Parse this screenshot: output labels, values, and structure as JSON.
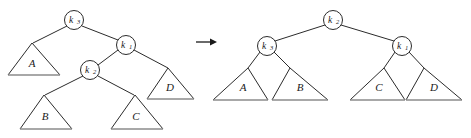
{
  "figure": {
    "transition_symbol": "→"
  },
  "colors": {
    "stroke": "#2b2b2b",
    "base_stroke": "#8b8b8b",
    "text": "#1a1a1a",
    "background": "#ffffff"
  },
  "left_tree": {
    "name": "before-rotation-tree",
    "nodes": [
      {
        "id": "L-k3",
        "key": "k",
        "subscript": "3",
        "label": "k3",
        "cx": 74,
        "cy": 20,
        "r": 9.5
      },
      {
        "id": "L-k1",
        "key": "k",
        "subscript": "1",
        "label": "k1",
        "cx": 126,
        "cy": 45,
        "r": 9.5
      },
      {
        "id": "L-k2",
        "key": "k",
        "subscript": "2",
        "label": "k2",
        "cx": 90,
        "cy": 70,
        "r": 9.5
      }
    ],
    "subtrees": [
      {
        "id": "L-A",
        "label": "A",
        "apex": [
          32,
          43
        ],
        "left": [
          8,
          75
        ],
        "right": [
          60,
          75
        ],
        "label_x": 32,
        "label_y": 64
      },
      {
        "id": "L-B",
        "label": "B",
        "apex": [
          44,
          95
        ],
        "left": [
          20,
          129
        ],
        "right": [
          72,
          129
        ],
        "label_x": 45,
        "label_y": 117
      },
      {
        "id": "L-C",
        "label": "C",
        "apex": [
          135,
          95
        ],
        "left": [
          111,
          129
        ],
        "right": [
          163,
          129
        ],
        "label_x": 136,
        "label_y": 117
      },
      {
        "id": "L-D",
        "label": "D",
        "apex": [
          168,
          68
        ],
        "left": [
          147,
          99
        ],
        "right": [
          194,
          99
        ],
        "label_x": 170,
        "label_y": 88
      }
    ],
    "edges": [
      {
        "from": "L-k3",
        "to": "L-A"
      },
      {
        "from": "L-k3",
        "to": "L-k1"
      },
      {
        "from": "L-k1",
        "to": "L-k2"
      },
      {
        "from": "L-k1",
        "to": "L-D"
      },
      {
        "from": "L-k2",
        "to": "L-B"
      },
      {
        "from": "L-k2",
        "to": "L-C"
      }
    ]
  },
  "right_tree": {
    "name": "after-rotation-tree",
    "nodes": [
      {
        "id": "R-k2",
        "key": "k",
        "subscript": "2",
        "label": "k2",
        "cx": 333,
        "cy": 20,
        "r": 9.5
      },
      {
        "id": "R-k3",
        "key": "k",
        "subscript": "3",
        "label": "k3",
        "cx": 267,
        "cy": 46,
        "r": 9.5
      },
      {
        "id": "R-k1",
        "key": "k",
        "subscript": "1",
        "label": "k1",
        "cx": 402,
        "cy": 46,
        "r": 9.5
      }
    ],
    "subtrees": [
      {
        "id": "R-A",
        "label": "A",
        "apex": [
          248,
          68
        ],
        "left": [
          213,
          100
        ],
        "right": [
          268,
          100
        ],
        "label_x": 243,
        "label_y": 88
      },
      {
        "id": "R-B",
        "label": "B",
        "apex": [
          290,
          68
        ],
        "left": [
          272,
          100
        ],
        "right": [
          328,
          100
        ],
        "label_x": 300,
        "label_y": 88
      },
      {
        "id": "R-C",
        "label": "C",
        "apex": [
          384,
          68
        ],
        "left": [
          350,
          100
        ],
        "right": [
          405,
          100
        ],
        "label_x": 379,
        "label_y": 88
      },
      {
        "id": "R-D",
        "label": "D",
        "apex": [
          424,
          68
        ],
        "left": [
          406,
          100
        ],
        "right": [
          462,
          100
        ],
        "label_x": 434,
        "label_y": 88
      }
    ],
    "edges": [
      {
        "from": "R-k2",
        "to": "R-k3"
      },
      {
        "from": "R-k2",
        "to": "R-k1"
      },
      {
        "from": "R-k3",
        "to": "R-A"
      },
      {
        "from": "R-k3",
        "to": "R-B"
      },
      {
        "from": "R-k1",
        "to": "R-C"
      },
      {
        "from": "R-k1",
        "to": "R-D"
      }
    ]
  },
  "arrow": {
    "name": "transition-arrow",
    "x1": 196,
    "y1": 42,
    "x2": 216,
    "y2": 42
  }
}
